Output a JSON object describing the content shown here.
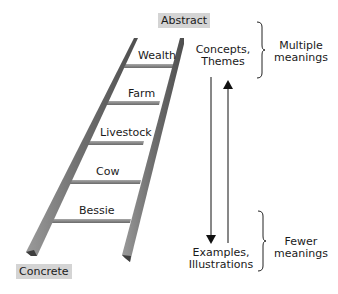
{
  "ends": {
    "top": "Abstract",
    "bottom": "Concrete"
  },
  "rungs": [
    {
      "label": "Wealth"
    },
    {
      "label": "Farm"
    },
    {
      "label": "Livestock"
    },
    {
      "label": "Cow"
    },
    {
      "label": "Bessie"
    }
  ],
  "levels": {
    "top": {
      "line1": "Concepts,",
      "line2": "Themes"
    },
    "bottom": {
      "line1": "Examples,",
      "line2": "Illustrations"
    }
  },
  "meanings": {
    "top": {
      "line1": "Multiple",
      "line2": "meanings"
    },
    "bottom": {
      "line1": "Fewer",
      "line2": "meanings"
    }
  },
  "colors": {
    "rail": "#7a7a7a",
    "rail_dark": "#555555",
    "rung": "#8a8a8a",
    "tag_bg": "#d4d4d4",
    "arrow": "#111111"
  }
}
